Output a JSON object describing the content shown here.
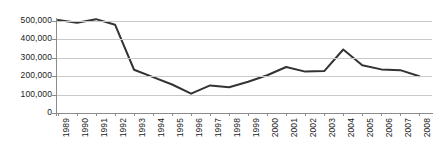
{
  "chart_data": {
    "type": "line",
    "title": "",
    "subtitle": "",
    "xlabel": "",
    "ylabel": "",
    "categories": [
      "1989",
      "1990",
      "1991",
      "1992",
      "1993",
      "1994",
      "1995",
      "1996",
      "1997",
      "1998",
      "1999",
      "2000",
      "2001",
      "2002",
      "2003",
      "2004",
      "2005",
      "2006",
      "2007",
      "2008"
    ],
    "values": [
      505000,
      490000,
      510000,
      480000,
      235000,
      195000,
      155000,
      105000,
      150000,
      140000,
      170000,
      205000,
      250000,
      225000,
      228000,
      345000,
      260000,
      237000,
      233000,
      200000
    ],
    "series": [
      {
        "name": "",
        "values": [
          505000,
          490000,
          510000,
          480000,
          235000,
          195000,
          155000,
          105000,
          150000,
          140000,
          170000,
          205000,
          250000,
          225000,
          228000,
          345000,
          260000,
          237000,
          233000,
          200000
        ]
      }
    ],
    "ylim": [
      0,
      550000
    ],
    "yticks": [
      0,
      100000,
      200000,
      300000,
      400000,
      500000
    ],
    "ytick_labels": [
      "0",
      "100,000",
      "200,000",
      "300,000",
      "400,000",
      "500,000"
    ],
    "grid": true,
    "legend": false,
    "legend_position": "none",
    "annotations": [],
    "colors": {
      "line": "#333333",
      "grid": "#c9c9c9",
      "axis": "#8c8c8c",
      "text": "#1b1b1b",
      "background": "#ffffff"
    }
  }
}
